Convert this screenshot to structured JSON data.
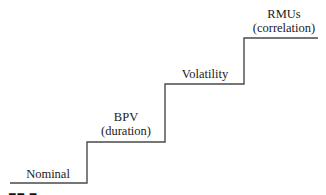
{
  "diagram": {
    "type": "staircase",
    "line_color": "#4a4a4a",
    "steps": [
      {
        "label": "Nominal",
        "sublabel": ""
      },
      {
        "label": "BPV",
        "sublabel": "(duration)"
      },
      {
        "label": "Volatility",
        "sublabel": ""
      },
      {
        "label": "RMUs",
        "sublabel": "(correlation)"
      }
    ]
  }
}
